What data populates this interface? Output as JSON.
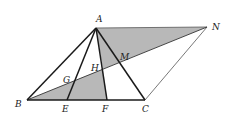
{
  "diagram": {
    "colors": {
      "stroke": "#1a1a1a",
      "thin_stroke": "#444444",
      "shade": "#b8b8b8",
      "label": "#222222"
    },
    "points": {
      "A": {
        "x": 96,
        "y": 28
      },
      "N": {
        "x": 207,
        "y": 27
      },
      "B": {
        "x": 27,
        "y": 100
      },
      "E": {
        "x": 67,
        "y": 100
      },
      "F": {
        "x": 107,
        "y": 100
      },
      "C": {
        "x": 145,
        "y": 100
      },
      "G": {
        "x": 73,
        "y": 80
      },
      "H": {
        "x": 103,
        "y": 69
      },
      "M": {
        "x": 120,
        "y": 63
      }
    },
    "labels": {
      "A": "A",
      "N": "N",
      "M": "M",
      "H": "H",
      "G": "G",
      "B": "B",
      "E": "E",
      "F": "F",
      "C": "C"
    },
    "shaded_regions": [
      {
        "name": "upper-shaded-triangle",
        "vertices": [
          "A",
          "N",
          "H"
        ]
      },
      {
        "name": "lower-shaded-triangle",
        "vertices": [
          "B",
          "H",
          "F"
        ]
      }
    ],
    "segments": [
      {
        "from": "A",
        "to": "B",
        "weight": "bold"
      },
      {
        "from": "A",
        "to": "E",
        "weight": "bold"
      },
      {
        "from": "A",
        "to": "F",
        "weight": "bold"
      },
      {
        "from": "A",
        "to": "C",
        "weight": "bold"
      },
      {
        "from": "B",
        "to": "C",
        "weight": "bold"
      },
      {
        "from": "B",
        "to": "N",
        "weight": "thin"
      },
      {
        "from": "A",
        "to": "N",
        "weight": "thin"
      },
      {
        "from": "C",
        "to": "N",
        "weight": "thin"
      }
    ]
  }
}
